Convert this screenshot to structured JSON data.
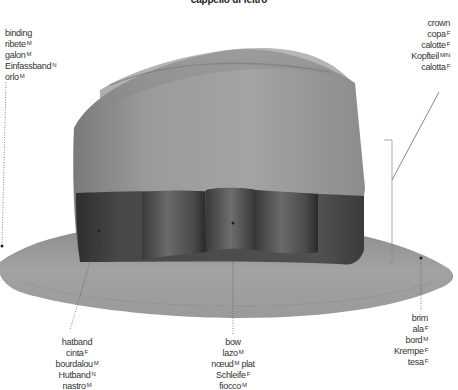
{
  "title": "cappello di feltro",
  "parts": {
    "binding": {
      "terms": [
        {
          "word": "binding",
          "gender": ""
        },
        {
          "word": "ribete",
          "gender": "M"
        },
        {
          "word": "galon",
          "gender": "M"
        },
        {
          "word": "Einfassband",
          "gender": "N"
        },
        {
          "word": "orlo",
          "gender": "M"
        }
      ]
    },
    "crown": {
      "terms": [
        {
          "word": "crown",
          "gender": ""
        },
        {
          "word": "copa",
          "gender": "F"
        },
        {
          "word": "calotte",
          "gender": "F"
        },
        {
          "word": "Kopfteil",
          "gender": "M/N"
        },
        {
          "word": "calotta",
          "gender": "F"
        }
      ]
    },
    "hatband": {
      "terms": [
        {
          "word": "hatband",
          "gender": ""
        },
        {
          "word": "cinta",
          "gender": "F"
        },
        {
          "word": "bourdalou",
          "gender": "M"
        },
        {
          "word": "Hutband",
          "gender": "N"
        },
        {
          "word": "nastro",
          "gender": "M"
        }
      ]
    },
    "bow": {
      "terms": [
        {
          "word": "bow",
          "gender": ""
        },
        {
          "word": "lazo",
          "gender": "M"
        },
        {
          "word": "nœud",
          "gender": "M",
          "suffix": " plat"
        },
        {
          "word": "Schleife",
          "gender": "F"
        },
        {
          "word": "fiocco",
          "gender": "M"
        }
      ]
    },
    "brim": {
      "terms": [
        {
          "word": "brim",
          "gender": ""
        },
        {
          "word": "ala",
          "gender": "F"
        },
        {
          "word": "bord",
          "gender": "M"
        },
        {
          "word": "Krempe",
          "gender": "F"
        },
        {
          "word": "tesa",
          "gender": "F"
        }
      ]
    }
  },
  "colors": {
    "felt": "#8f8f8f",
    "felt_light": "#a8a8a8",
    "band": "#4a4a4a",
    "brim": "#9a9a9a",
    "leader": "#555555"
  }
}
